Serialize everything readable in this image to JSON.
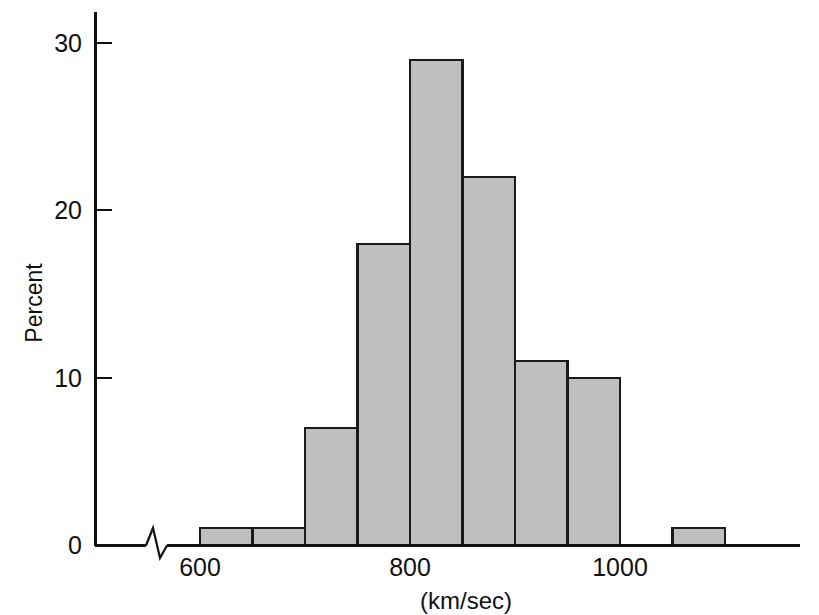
{
  "chart_data": {
    "type": "bar",
    "title": "",
    "subtitle": "",
    "xlabel": "(km/sec)",
    "ylabel": "Percent",
    "xlim": [
      575,
      1125
    ],
    "ylim": [
      0,
      32
    ],
    "grid": false,
    "legend": null,
    "bin_width": 50,
    "x_tick_labels": [
      "600",
      "800",
      "1000"
    ],
    "x_tick_values": [
      600,
      800,
      1000
    ],
    "y_tick_labels": [
      "0",
      "10",
      "20",
      "30"
    ],
    "y_tick_values": [
      0,
      10,
      20,
      30
    ],
    "axis_break": true,
    "axis_break_note": "zigzag break on x-axis between origin and 600",
    "bin_starts": [
      600,
      650,
      700,
      750,
      800,
      850,
      900,
      950,
      1000,
      1050
    ],
    "bin_ends": [
      650,
      700,
      750,
      800,
      850,
      900,
      950,
      1000,
      1050,
      1100
    ],
    "categories": [
      "600-650",
      "650-700",
      "700-750",
      "750-800",
      "800-850",
      "850-900",
      "900-950",
      "950-1000",
      "1000-1050",
      "1050-1100"
    ],
    "values": [
      1,
      1,
      7,
      18,
      29,
      22,
      11,
      10,
      0,
      1
    ]
  },
  "style": {
    "bar_fill": "#bfbfbf",
    "bar_stroke": "#1a1a1a",
    "axis_color": "#111111",
    "background": "#ffffff"
  }
}
